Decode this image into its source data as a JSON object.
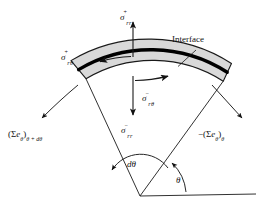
{
  "figure": {
    "background_color": "#ffffff",
    "band_fill_color": "#d9d9d9",
    "interface_color": "#000000",
    "line_color": "#1a1a1a",
    "labels": {
      "sigma_rr_plus": {
        "symbol": "σ",
        "superscript": "+",
        "subscript": "rr"
      },
      "sigma_rtheta_plus": {
        "symbol": "σ",
        "superscript": "+",
        "subscript": "rθ"
      },
      "sigma_rtheta_minus": {
        "symbol": "σ",
        "superscript": "−",
        "subscript": "rθ"
      },
      "sigma_rr_minus": {
        "symbol": "σ",
        "superscript": "−",
        "subscript": "rr"
      },
      "interface": "Interface",
      "flux_left": {
        "open": "(",
        "sigma": "Σ",
        "e": "e",
        "e_sub": "θ",
        "close": ")",
        "sub": "θ + dθ",
        "sign": ""
      },
      "flux_right": {
        "open": "(",
        "sigma": "Σ",
        "e": "e",
        "e_sub": "θ",
        "close": ")",
        "sub": "θ",
        "sign": "−"
      },
      "d_theta": "dθ",
      "theta": "θ"
    },
    "annotations": {
      "arrow_up_name": "sigma-rr-plus-arrow",
      "arrow_down_name": "sigma-rr-minus-arrow",
      "shear_outer_direction": "left",
      "shear_inner_direction": "right",
      "leader_to_interface": true,
      "baseline_present": true
    }
  }
}
